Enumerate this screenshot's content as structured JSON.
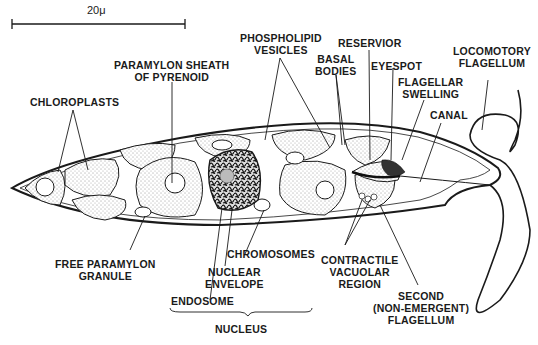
{
  "scale_bar": {
    "label": "20μ"
  },
  "labels": {
    "chloroplasts": "CHLOROPLASTS",
    "paramylon_sheath": [
      "PARAMYLON SHEATH",
      "OF PYRENOID"
    ],
    "phospholipid_vesicles": [
      "PHOSPHOLIPID",
      "VESICLES"
    ],
    "reservoir": "RESERVIOR",
    "basal_bodies": [
      "BASAL",
      "BODIES"
    ],
    "eyespot": "EYESPOT",
    "flagellar_swelling": [
      "FLAGELLAR",
      "SWELLING"
    ],
    "locomotory_flagellum": [
      "LOCOMOTORY",
      "FLAGELLUM"
    ],
    "canal": "CANAL",
    "free_paramylon": [
      "FREE PARAMYLON",
      "GRANULE"
    ],
    "chromosomes": "CHROMOSOMES",
    "nuclear_envelope": [
      "NUCLEAR",
      "ENVELOPE"
    ],
    "endosome": "ENDOSOME",
    "nucleus": "NUCLEUS",
    "contractile_vacuolar": [
      "CONTRACTILE",
      "VACUOLAR",
      "REGION"
    ],
    "second_flagellum": [
      "SECOND",
      "(NON-EMERGENT)",
      "FLAGELLUM"
    ]
  },
  "colors": {
    "ink": "#1a1a1a",
    "background": "#ffffff",
    "stipple": "#e6e6e6"
  }
}
